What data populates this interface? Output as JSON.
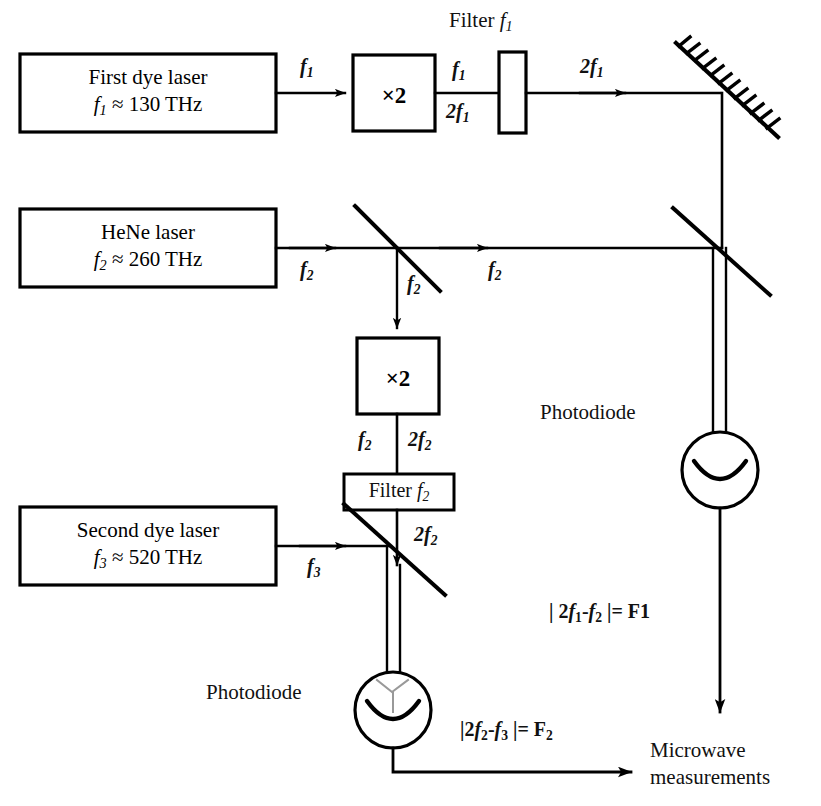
{
  "diagram": {
    "type": "optical-frequency-chain-schematic",
    "background_color": "#ffffff",
    "line_color": "#000000"
  },
  "sources": [
    {
      "id": "first-dye-laser",
      "name": "First dye laser",
      "frequency_symbol": "f",
      "frequency_index": "1",
      "frequency_text": "f₁ ≈ 130 THz",
      "approx": "≈",
      "value": "130",
      "unit": "THz",
      "line1": "First dye laser",
      "line2_sym": "f",
      "line2_sub": "1",
      "line2_rest": " ≈ 130 THz"
    },
    {
      "id": "hene-laser",
      "name": "HeNe laser",
      "frequency_symbol": "f",
      "frequency_index": "2",
      "frequency_text": "f₂ ≈ 260 THz",
      "approx": "≈",
      "value": "260",
      "unit": "THz",
      "line1": "HeNe laser",
      "line2_sym": "f",
      "line2_sub": "2",
      "line2_rest": " ≈ 260 THz"
    },
    {
      "id": "second-dye-laser",
      "name": "Second dye laser",
      "frequency_symbol": "f",
      "frequency_index": "3",
      "frequency_text": "f₃ ≈ 520 THz",
      "approx": "≈",
      "value": "520",
      "unit": "THz",
      "line1": "Second dye laser",
      "line2_sym": "f",
      "line2_sub": "3",
      "line2_rest": " ≈ 520 THz"
    }
  ],
  "doublers": [
    {
      "id": "doubler-top",
      "label": "×2"
    },
    {
      "id": "doubler-middle",
      "label": "×2"
    }
  ],
  "filters": [
    {
      "id": "filter-f1",
      "label": "Filter",
      "symbol": "f",
      "sub": "1",
      "full": "Filter f₁",
      "style": "external-label"
    },
    {
      "id": "filter-f2",
      "label": "Filter",
      "symbol": "f",
      "sub": "2",
      "full": "Filter f₂",
      "style": "boxed-label"
    }
  ],
  "beam_labels": [
    {
      "id": "beam-f1-in",
      "sym": "f",
      "sub": "1",
      "text": "f₁"
    },
    {
      "id": "beam-f1-out",
      "sym": "f",
      "sub": "1",
      "text": "f₁"
    },
    {
      "id": "beam-2f1-out",
      "pre": "2",
      "sym": "f",
      "sub": "1",
      "text": "2f₁"
    },
    {
      "id": "beam-2f1-mirror",
      "pre": "2",
      "sym": "f",
      "sub": "1",
      "text": "2f₁"
    },
    {
      "id": "beam-f2-source",
      "sym": "f",
      "sub": "2",
      "text": "f₂"
    },
    {
      "id": "beam-f2-down",
      "sym": "f",
      "sub": "2",
      "text": "f₂"
    },
    {
      "id": "beam-f2-right",
      "sym": "f",
      "sub": "2",
      "text": "f₂"
    },
    {
      "id": "beam-f2-filter-left",
      "sym": "f",
      "sub": "2",
      "text": "f₂"
    },
    {
      "id": "beam-2f2-doubler",
      "pre": "2",
      "sym": "f",
      "sub": "2",
      "text": "2f₂"
    },
    {
      "id": "beam-2f2-filtered",
      "pre": "2",
      "sym": "f",
      "sub": "2",
      "text": "2f₂"
    },
    {
      "id": "beam-f3-source",
      "sym": "f",
      "sub": "3",
      "text": "f₃"
    }
  ],
  "detectors": [
    {
      "id": "photodiode-upper",
      "label": "Photodiode"
    },
    {
      "id": "photodiode-lower",
      "label": "Photodiode"
    }
  ],
  "beat_notes": [
    {
      "id": "beat-f1",
      "text": "| 2f₁ - f₂ |= F1",
      "bar_open": "|",
      "lhs_pre": "2",
      "lhs_sym": "f",
      "lhs_sub": "1",
      "minus": "-",
      "rhs_sym": "f",
      "rhs_sub": "2",
      "bar_close": "|",
      "equals": "=",
      "result": "F1"
    },
    {
      "id": "beat-f2",
      "text": "|2f₂ - f₃ |= F₂",
      "bar_open": "|",
      "lhs_pre": "2",
      "lhs_sym": "f",
      "lhs_sub": "2",
      "minus": "-",
      "rhs_sym": "f",
      "rhs_sub": "3",
      "bar_close": "|",
      "equals": "=",
      "result_sym": "F",
      "result_sub": "2",
      "result": "F₂"
    }
  ],
  "output": {
    "id": "microwave-measurements",
    "line1": "Microwave",
    "line2": "measurements",
    "full": "Microwave measurements"
  },
  "optics": {
    "mirror": {
      "id": "mirror-top-right",
      "kind": "hatched-mirror"
    },
    "beamsplitters": [
      {
        "id": "beamsplitter-hene",
        "kind": "beamsplitter"
      },
      {
        "id": "beamsplitter-upper-right",
        "kind": "beamsplitter"
      },
      {
        "id": "beamsplitter-lower",
        "kind": "beamsplitter"
      }
    ]
  }
}
